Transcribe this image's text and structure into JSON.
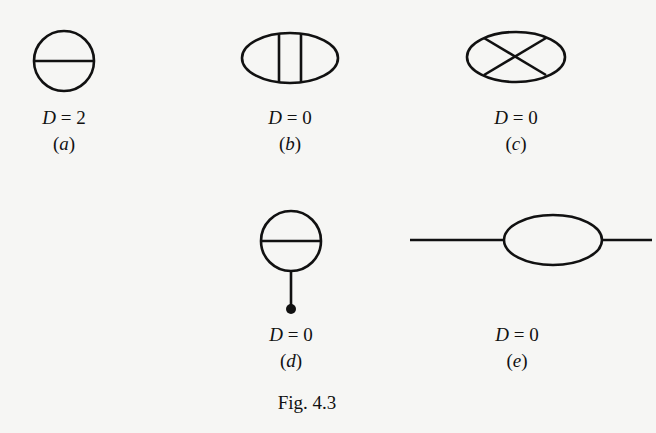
{
  "figure": {
    "caption": "Fig. 4.3",
    "stroke_color": "#111111",
    "background": "#f6f6f4",
    "diagrams": [
      {
        "id": "a",
        "tag": "a",
        "D_var": "D",
        "D_eq": " = 2",
        "shape": "circle with horizontal chord (sunset/double-scoop vacuum diagram)"
      },
      {
        "id": "b",
        "tag": "b",
        "D_var": "D",
        "D_eq": " = 0",
        "shape": "ellipse with two vertical internal lines (ladder vacuum diagram)"
      },
      {
        "id": "c",
        "tag": "c",
        "D_var": "D",
        "D_eq": " = 0",
        "shape": "ellipse with crossed internal lines (X vacuum diagram)"
      },
      {
        "id": "d",
        "tag": "d",
        "D_var": "D",
        "D_eq": " = 0",
        "shape": "circle with horizontal chord and a tadpole stem ending in a dot"
      },
      {
        "id": "e",
        "tag": "e",
        "D_var": "D",
        "D_eq": " = 0",
        "shape": "one-loop bubble with two external legs (self-energy)"
      }
    ]
  }
}
